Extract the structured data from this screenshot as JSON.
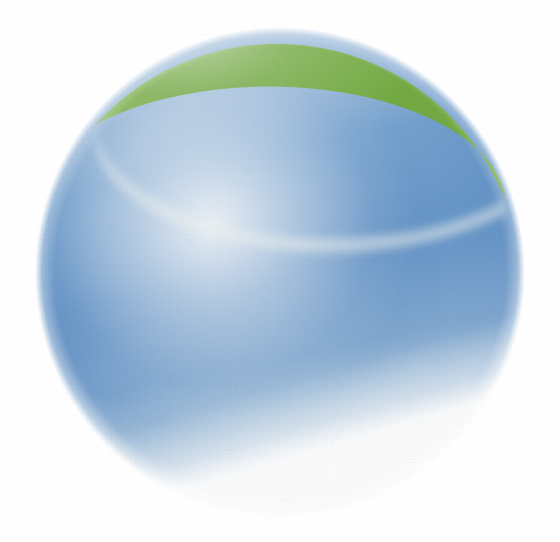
{
  "document": {
    "title": "Two-tone sphere illustration",
    "background_color": "#ffffff",
    "width": 560,
    "height": 542
  },
  "rule": {
    "name": "horizontal-rule",
    "color": "#141414",
    "x": 0,
    "y": 11,
    "width": 544,
    "height": 4
  },
  "sphere": {
    "name": "sphere",
    "center_x": 280,
    "center_y": 273,
    "radius_x": 244,
    "radius_y": 245,
    "edge_softness_px": 10,
    "texture": "airbrush-stipple"
  },
  "regions": {
    "green_cap": {
      "label": "green-cap",
      "color_dark": "#6aa537",
      "color_mid": "#86b74f",
      "color_light": "#cfe0b1",
      "color_pale": "#eef3e2",
      "boundary_left_x": 95,
      "boundary_left_y": 125,
      "boundary_right_x": 505,
      "boundary_right_y": 200,
      "boundary_low_x": 300,
      "boundary_low_y": 262
    },
    "blue_body": {
      "label": "blue-body",
      "color_dark": "#4f85bf",
      "color_mid": "#6c9ccd",
      "color_light": "#b9d0e6",
      "color_pale": "#e6eef6",
      "highlight_x": 205,
      "highlight_y": 300,
      "highlight_radius": 150
    }
  },
  "palette": {
    "green": "#6aa537",
    "blue": "#5d8fc4",
    "ink": "#141414",
    "paper": "#ffffff"
  }
}
